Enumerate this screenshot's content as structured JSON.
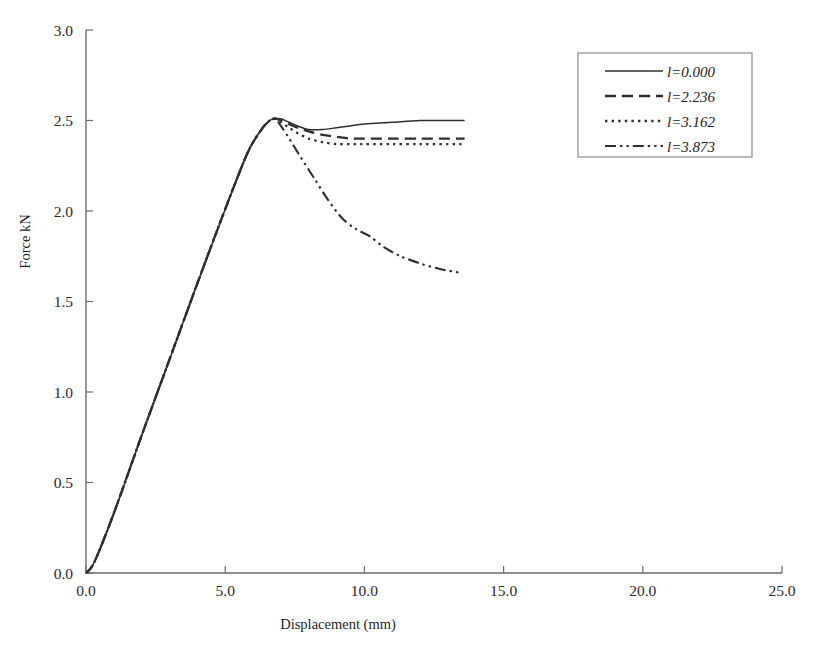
{
  "chart_data": {
    "type": "line",
    "title": "",
    "xlabel": "Displacement (mm)",
    "ylabel": "Force kN",
    "xlim": [
      0.0,
      25.0
    ],
    "ylim": [
      0.0,
      3.0
    ],
    "xticks": [
      "0.0",
      "5.0",
      "10.0",
      "15.0",
      "20.0",
      "25.0"
    ],
    "xtick_values": [
      0.0,
      5.0,
      10.0,
      15.0,
      20.0,
      25.0
    ],
    "yticks": [
      "0.0",
      "0.5",
      "1.0",
      "1.5",
      "2.0",
      "2.5",
      "3.0"
    ],
    "ytick_values": [
      0.0,
      0.5,
      1.0,
      1.5,
      2.0,
      2.5,
      3.0
    ],
    "grid": false,
    "legend_position": "top-right",
    "series": [
      {
        "name": "l=0.000",
        "style": "solid",
        "x": [
          0.0,
          0.3,
          1.0,
          2.0,
          3.0,
          4.0,
          5.0,
          5.8,
          6.3,
          6.6,
          6.8,
          7.0,
          7.3,
          7.6,
          8.0,
          8.5,
          9.0,
          9.5,
          10.0,
          11.0,
          12.0,
          13.0,
          13.6
        ],
        "y": [
          0.0,
          0.06,
          0.33,
          0.76,
          1.18,
          1.6,
          2.01,
          2.32,
          2.45,
          2.5,
          2.51,
          2.51,
          2.49,
          2.47,
          2.45,
          2.45,
          2.46,
          2.47,
          2.48,
          2.49,
          2.5,
          2.5,
          2.5
        ]
      },
      {
        "name": "l=2.236",
        "style": "dashed",
        "x": [
          0.0,
          0.3,
          1.0,
          2.0,
          3.0,
          4.0,
          5.0,
          5.8,
          6.3,
          6.6,
          6.8,
          7.0,
          7.3,
          7.6,
          8.0,
          8.5,
          9.0,
          9.5,
          10.0,
          11.0,
          12.0,
          13.0,
          13.6
        ],
        "y": [
          0.0,
          0.06,
          0.33,
          0.76,
          1.18,
          1.6,
          2.01,
          2.32,
          2.45,
          2.5,
          2.51,
          2.5,
          2.48,
          2.46,
          2.44,
          2.42,
          2.41,
          2.4,
          2.4,
          2.4,
          2.4,
          2.4,
          2.4
        ]
      },
      {
        "name": "l=3.162",
        "style": "dotted",
        "x": [
          0.0,
          0.3,
          1.0,
          2.0,
          3.0,
          4.0,
          5.0,
          5.8,
          6.3,
          6.6,
          6.8,
          7.0,
          7.3,
          7.6,
          8.0,
          8.5,
          9.0,
          9.5,
          10.0,
          11.0,
          12.0,
          13.0,
          13.6
        ],
        "y": [
          0.0,
          0.06,
          0.33,
          0.76,
          1.18,
          1.6,
          2.01,
          2.32,
          2.45,
          2.5,
          2.51,
          2.49,
          2.46,
          2.43,
          2.4,
          2.38,
          2.37,
          2.37,
          2.37,
          2.37,
          2.37,
          2.37,
          2.37
        ]
      },
      {
        "name": "l=3.873",
        "style": "dash-dot-dot",
        "x": [
          0.0,
          0.3,
          1.0,
          2.0,
          3.0,
          4.0,
          5.0,
          5.8,
          6.3,
          6.6,
          6.8,
          7.0,
          7.3,
          7.7,
          8.2,
          8.7,
          9.2,
          9.7,
          10.2,
          10.7,
          11.3,
          12.0,
          12.7,
          13.4
        ],
        "y": [
          0.0,
          0.06,
          0.33,
          0.76,
          1.18,
          1.6,
          2.01,
          2.32,
          2.45,
          2.5,
          2.51,
          2.47,
          2.4,
          2.3,
          2.18,
          2.06,
          1.96,
          1.9,
          1.86,
          1.8,
          1.75,
          1.71,
          1.68,
          1.66
        ]
      }
    ],
    "legend_entries": [
      {
        "label": "l=0.000",
        "style": "solid"
      },
      {
        "label": "l=2.236",
        "style": "dashed"
      },
      {
        "label": "l=3.162",
        "style": "dotted"
      },
      {
        "label": "l=3.873",
        "style": "dash-dot-dot"
      }
    ],
    "colors": {
      "series_stroke": "#2e2e2e",
      "axis_stroke": "#6b6b6b",
      "legend_border": "#8a8a8a",
      "background": "#ffffff",
      "text": "#1f1f1f"
    }
  }
}
